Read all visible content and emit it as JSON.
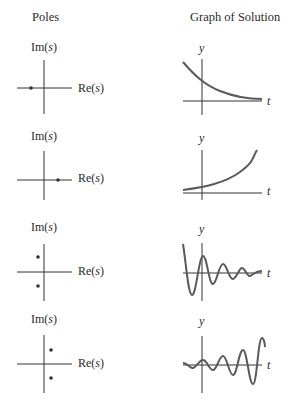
{
  "headers": {
    "poles": "Poles",
    "graph": "Graph of Solution"
  },
  "labels": {
    "im_prefix": "Im(",
    "re_prefix": "Re(",
    "var_s": "s",
    "close": ")",
    "y": "y",
    "t": "t"
  },
  "colors": {
    "axis": "#333333",
    "curve": "#5a5a5a",
    "pole": "#333333",
    "text": "#2a2a2a"
  },
  "rows": [
    {
      "id": "real-negative",
      "poles": [
        {
          "re": -1,
          "im": 0
        }
      ],
      "behavior": "exponential decay"
    },
    {
      "id": "real-positive",
      "poles": [
        {
          "re": 1,
          "im": 0
        }
      ],
      "behavior": "exponential growth"
    },
    {
      "id": "complex-negative-real",
      "poles": [
        {
          "re": -1,
          "im": 1
        },
        {
          "re": -1,
          "im": -1
        }
      ],
      "behavior": "decaying oscillation"
    },
    {
      "id": "complex-positive-real",
      "poles": [
        {
          "re": 1,
          "im": 1
        },
        {
          "re": 1,
          "im": -1
        }
      ],
      "behavior": "growing oscillation"
    }
  ]
}
